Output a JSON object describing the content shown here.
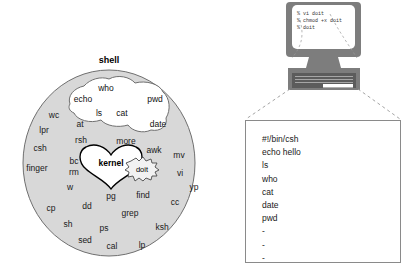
{
  "figure": {
    "colors": {
      "shell_fill": "#d8d8d8",
      "shell_stroke": "#6f6f6f",
      "blob_fill": "#ffffff",
      "blob_stroke": "#6f6f6f",
      "kernel_fill": "#ffffff",
      "kernel_stroke": "#000000",
      "doit_fill": "#f2f2f2",
      "doit_stroke": "#4a4a4a",
      "monitor_fill": "#7d7d7d",
      "monitor_dark": "#5c5c5c",
      "screen_fill": "#ffffff",
      "box_stroke": "#8a8a8a",
      "dash_stroke": "#9a9a9a",
      "text": "#1a1a1a"
    }
  },
  "shell_diagram": {
    "label": "shell",
    "kernel_label": "kernel",
    "doit_label": "doit",
    "blob_commands": [
      {
        "label": "who",
        "x": 106,
        "y": 88
      },
      {
        "label": "echo",
        "x": 83,
        "y": 99
      },
      {
        "label": "pwd",
        "x": 155,
        "y": 99
      },
      {
        "label": "ls",
        "x": 99,
        "y": 113
      },
      {
        "label": "cat",
        "x": 122,
        "y": 113
      },
      {
        "label": "date",
        "x": 158,
        "y": 124
      }
    ],
    "shell_commands": [
      {
        "label": "wc",
        "x": 54,
        "y": 115
      },
      {
        "label": "at",
        "x": 80,
        "y": 124
      },
      {
        "label": "lpr",
        "x": 44,
        "y": 130
      },
      {
        "label": "rsh",
        "x": 81,
        "y": 140
      },
      {
        "label": "more",
        "x": 126,
        "y": 141
      },
      {
        "label": "csh",
        "x": 40,
        "y": 148
      },
      {
        "label": "awk",
        "x": 154,
        "y": 150
      },
      {
        "label": "mv",
        "x": 179,
        "y": 155
      },
      {
        "label": "bc",
        "x": 74,
        "y": 161
      },
      {
        "label": "finger",
        "x": 37,
        "y": 168
      },
      {
        "label": "rm",
        "x": 74,
        "y": 172
      },
      {
        "label": "vi",
        "x": 180,
        "y": 173
      },
      {
        "label": "yp",
        "x": 194,
        "y": 187
      },
      {
        "label": "w",
        "x": 70,
        "y": 187
      },
      {
        "label": "pg",
        "x": 111,
        "y": 196
      },
      {
        "label": "find",
        "x": 143,
        "y": 195
      },
      {
        "label": "cc",
        "x": 175,
        "y": 202
      },
      {
        "label": "cp",
        "x": 51,
        "y": 208
      },
      {
        "label": "dd",
        "x": 87,
        "y": 206
      },
      {
        "label": "grep",
        "x": 130,
        "y": 213
      },
      {
        "label": "sh",
        "x": 68,
        "y": 224
      },
      {
        "label": "ps",
        "x": 104,
        "y": 228
      },
      {
        "label": "ksh",
        "x": 162,
        "y": 227
      },
      {
        "label": "sed",
        "x": 85,
        "y": 240
      },
      {
        "label": "cal",
        "x": 112,
        "y": 246
      },
      {
        "label": "lp",
        "x": 142,
        "y": 245
      }
    ]
  },
  "computer": {
    "terminal_lines": [
      "% vi doit",
      "% chmod +x doit",
      "% doit"
    ]
  },
  "script_listing": {
    "lines": [
      "#!/bin/csh",
      "echo hello",
      "ls",
      "who",
      "cat",
      "date",
      "pwd",
      "-",
      "-",
      "-"
    ]
  }
}
